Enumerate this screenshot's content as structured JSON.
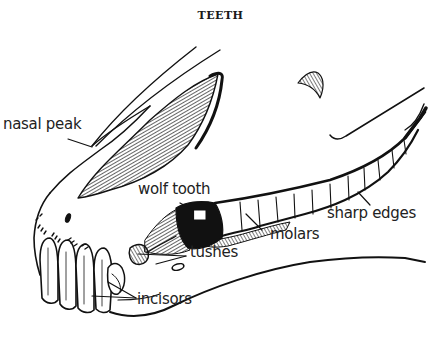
{
  "title": "TEETH",
  "labels": {
    "nasal_peak": "nasal peak",
    "wolf_tooth": "wolf tooth",
    "tushes": "tushes",
    "molars": "molars",
    "sharp_edges": "sharp edges",
    "incisors": "incisors"
  },
  "colors": {
    "ink": "#111111",
    "background": "#ffffff"
  }
}
